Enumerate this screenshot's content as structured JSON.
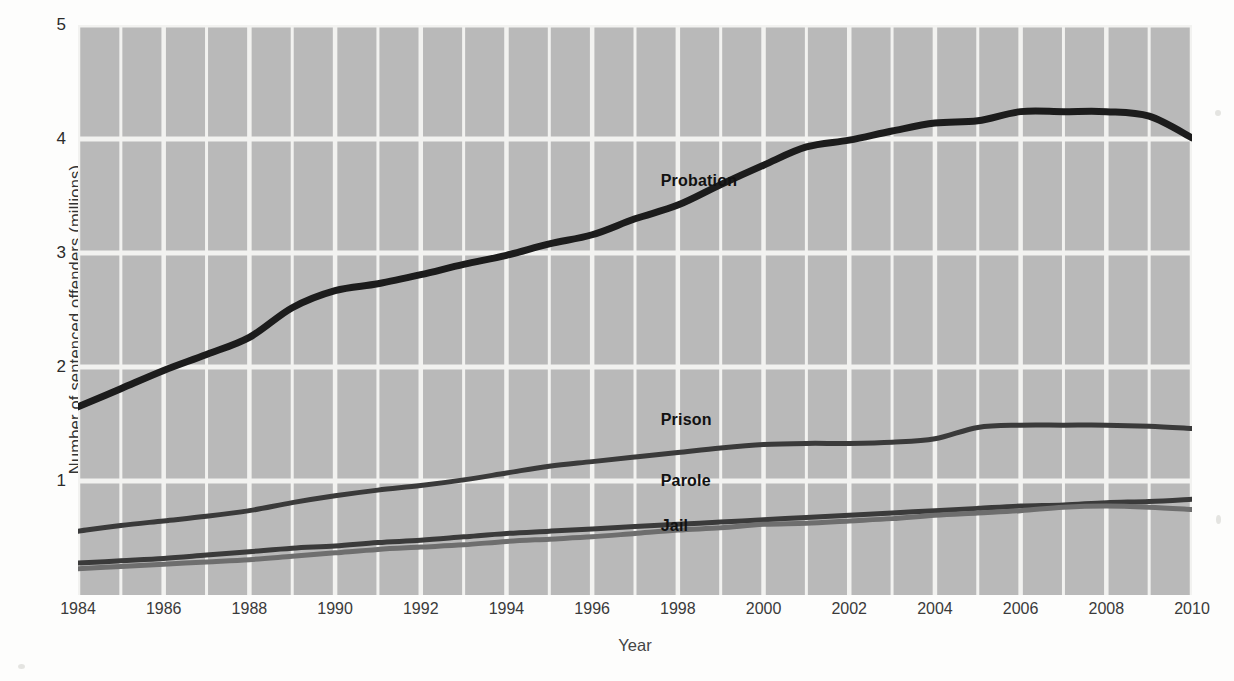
{
  "chart_data": {
    "type": "line",
    "title": "",
    "xlabel": "Year",
    "ylabel": "Number of sentenced offenders (millions)",
    "xlim": [
      1984,
      2010
    ],
    "ylim": [
      0,
      5
    ],
    "xticks": [
      1984,
      1986,
      1988,
      1990,
      1992,
      1994,
      1996,
      1998,
      2000,
      2002,
      2004,
      2006,
      2008,
      2010
    ],
    "yticks": [
      1,
      2,
      3,
      4,
      5
    ],
    "grid": true,
    "grid_color": "#f2f2f0",
    "plot_background": "#b9b9b9",
    "legend_position": "inline-labels",
    "x": [
      1984,
      1985,
      1986,
      1987,
      1988,
      1989,
      1990,
      1991,
      1992,
      1993,
      1994,
      1995,
      1996,
      1997,
      1998,
      1999,
      2000,
      2001,
      2002,
      2003,
      2004,
      2005,
      2006,
      2007,
      2008,
      2009,
      2010
    ],
    "series": [
      {
        "name": "Probation",
        "color": "#1c1c1c",
        "width": 7,
        "label_x": 1997.6,
        "label_y": 3.62,
        "values": [
          1.65,
          1.81,
          1.97,
          2.11,
          2.26,
          2.52,
          2.67,
          2.73,
          2.81,
          2.9,
          2.98,
          3.08,
          3.16,
          3.3,
          3.42,
          3.6,
          3.77,
          3.93,
          3.99,
          4.07,
          4.14,
          4.16,
          4.24,
          4.24,
          4.24,
          4.2,
          4.01
        ]
      },
      {
        "name": "Prison",
        "color": "#3a3a3a",
        "width": 5,
        "label_x": 1997.6,
        "label_y": 1.53,
        "values": [
          0.56,
          0.61,
          0.65,
          0.69,
          0.74,
          0.81,
          0.87,
          0.92,
          0.96,
          1.01,
          1.07,
          1.13,
          1.17,
          1.21,
          1.25,
          1.29,
          1.32,
          1.33,
          1.33,
          1.34,
          1.37,
          1.47,
          1.49,
          1.49,
          1.49,
          1.48,
          1.46
        ]
      },
      {
        "name": "Parole",
        "color": "#3a3a3a",
        "width": 5,
        "label_x": 1997.6,
        "label_y": 0.99,
        "values": [
          0.28,
          0.3,
          0.32,
          0.35,
          0.38,
          0.41,
          0.43,
          0.46,
          0.48,
          0.51,
          0.54,
          0.56,
          0.58,
          0.6,
          0.62,
          0.64,
          0.66,
          0.68,
          0.7,
          0.72,
          0.74,
          0.76,
          0.78,
          0.79,
          0.81,
          0.82,
          0.84
        ]
      },
      {
        "name": "Jail",
        "color": "#6e6e6e",
        "width": 5,
        "label_x": 1997.6,
        "label_y": 0.6,
        "values": [
          0.23,
          0.25,
          0.27,
          0.29,
          0.31,
          0.34,
          0.37,
          0.4,
          0.42,
          0.44,
          0.47,
          0.49,
          0.51,
          0.54,
          0.57,
          0.59,
          0.62,
          0.63,
          0.65,
          0.67,
          0.7,
          0.72,
          0.74,
          0.77,
          0.78,
          0.77,
          0.75
        ]
      }
    ]
  }
}
